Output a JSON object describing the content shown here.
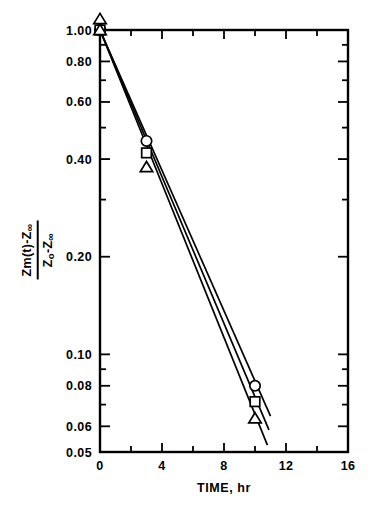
{
  "chart_data": {
    "type": "scatter",
    "title": "",
    "xlabel": "TIME, hr",
    "ylabel_numerator": "Zm(t)-Z",
    "ylabel_numerator_sub": "∞",
    "ylabel_denominator": "Z",
    "ylabel_denominator_sub1": "o",
    "ylabel_denominator_rest": "-Z",
    "ylabel_denominator_sub2": "∞",
    "ylabel_full": "[Zm(t)-Z∞] / [Zo-Z∞]",
    "xscale": "linear",
    "yscale": "log",
    "xlim": [
      0,
      16
    ],
    "ylim": [
      0.05,
      1.0
    ],
    "grid": false,
    "legend": "none",
    "x_ticks_major": [
      0,
      4,
      8,
      12,
      16
    ],
    "x_tick_labels": [
      "0",
      "4",
      "8",
      "12",
      "16"
    ],
    "x_ticks_minor": [
      2,
      6,
      10,
      14
    ],
    "y_ticks_labeled": [
      1.0,
      0.8,
      0.6,
      0.4,
      0.2,
      0.1,
      0.08,
      0.06,
      0.05
    ],
    "y_tick_labels": [
      "1.00",
      "0.80",
      "0.60",
      "0.40",
      "0.20",
      "0.10",
      "0.08",
      "0.06",
      "0.05"
    ],
    "y_ticks_minor": [
      0.9,
      0.7,
      0.5,
      0.3,
      0.09,
      0.07
    ],
    "series": [
      {
        "name": "circle-series",
        "marker": "circle",
        "x": [
          0,
          3,
          10
        ],
        "values": [
          1.0,
          0.455,
          0.08
        ],
        "fit_x": [
          0,
          11.0
        ],
        "fit_y": [
          1.0,
          0.0645
        ]
      },
      {
        "name": "square-series",
        "marker": "square",
        "x": [
          0,
          3,
          10
        ],
        "values": [
          1.0,
          0.418,
          0.0715
        ],
        "fit_x": [
          0,
          10.9
        ],
        "fit_y": [
          1.0,
          0.0585
        ]
      },
      {
        "name": "triangle-series",
        "marker": "triangle",
        "x": [
          0,
          3,
          10
        ],
        "values": [
          1.0,
          0.378,
          0.0635
        ],
        "fit_x": [
          0,
          10.8
        ],
        "fit_y": [
          1.0,
          0.0525
        ]
      }
    ],
    "extra_markers": [
      {
        "marker": "triangle",
        "x": 0,
        "y": 1.08,
        "note": "triangle sits above axis at t=0"
      }
    ],
    "colors": {
      "line": "#000000",
      "marker_edge": "#000000",
      "marker_fill": "#ffffff",
      "axis": "#000000",
      "background": "#ffffff"
    }
  }
}
